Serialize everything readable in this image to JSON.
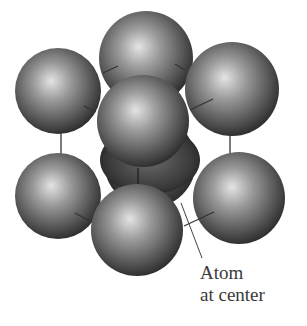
{
  "diagram": {
    "type": "body-centered cubic unit cell",
    "atoms": [
      {
        "id": "back-bottom-center",
        "cx": 150,
        "cy": 162,
        "r": 46
      },
      {
        "id": "top-back",
        "cx": 146,
        "cy": 58,
        "r": 47
      },
      {
        "id": "upper-left",
        "cx": 58,
        "cy": 91,
        "r": 43
      },
      {
        "id": "upper-right",
        "cx": 232,
        "cy": 89,
        "r": 47
      },
      {
        "id": "top-front",
        "cx": 143,
        "cy": 121,
        "r": 46
      },
      {
        "id": "lower-left",
        "cx": 58,
        "cy": 196,
        "r": 43
      },
      {
        "id": "lower-right",
        "cx": 239,
        "cy": 198,
        "r": 46
      },
      {
        "id": "lower-front",
        "cx": 137,
        "cy": 230,
        "r": 46
      }
    ],
    "label_line1": "Atom",
    "label_line2": "at center",
    "colors": {
      "sphere_light": "#e6e6e6",
      "sphere_mid": "#8a8a8a",
      "sphere_dark": "#2a2a2a",
      "line": "#333333"
    }
  }
}
